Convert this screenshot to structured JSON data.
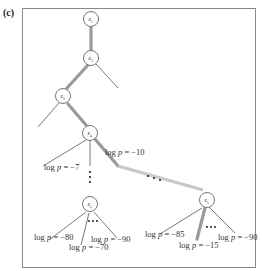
{
  "panel_label": "(c)",
  "colors": {
    "frame": "#888888",
    "edge": "#555555",
    "highlight_path": "#9a9a9a",
    "highlight_path_light": "#c8c8c8",
    "node_stroke": "#666666"
  },
  "nodes": [
    {
      "id": "z1",
      "label": "z",
      "sub": "1"
    },
    {
      "id": "z2",
      "label": "z",
      "sub": "2"
    },
    {
      "id": "z3",
      "label": "z",
      "sub": "3"
    },
    {
      "id": "z4",
      "label": "z",
      "sub": "4"
    },
    {
      "id": "z5_left",
      "label": "z",
      "sub": "5"
    },
    {
      "id": "z5_right",
      "label": "z",
      "sub": "5"
    }
  ],
  "edge_labels": {
    "z4_right": {
      "prefix": "log ",
      "var": "p",
      "suffix": " = −10"
    },
    "z4_child": {
      "prefix": "log ",
      "var": "p",
      "suffix": " = −7"
    },
    "left_leaf_1": {
      "prefix": "log ",
      "var": "p",
      "suffix": " = −80"
    },
    "left_leaf_2": {
      "prefix": "log ",
      "var": "p",
      "suffix": " = −70"
    },
    "left_leaf_3": {
      "prefix": "log ",
      "var": "p",
      "suffix": " = −90"
    },
    "right_leaf_1": {
      "prefix": "log ",
      "var": "p",
      "suffix": " = −85"
    },
    "right_leaf_2": {
      "prefix": "log ",
      "var": "p",
      "suffix": " = −15"
    },
    "right_leaf_3": {
      "prefix": "log ",
      "var": "p",
      "suffix": " = −90"
    }
  },
  "ellipsis": "…"
}
